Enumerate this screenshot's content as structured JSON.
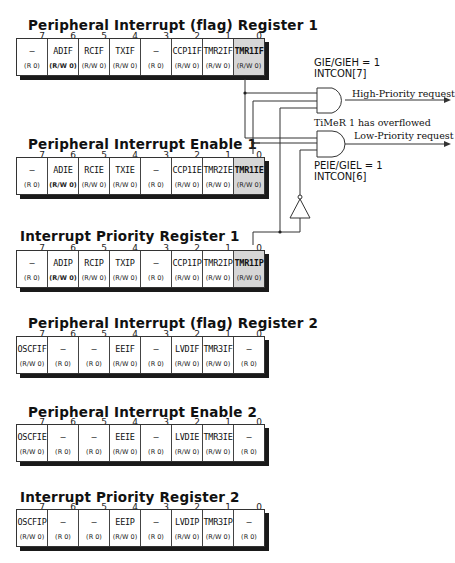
{
  "registers": [
    {
      "title": "Peripheral  Interrupt  (flag) Register 1",
      "bit_numbers": [
        "7",
        "6",
        "5",
        "4",
        "3",
        "2",
        "1",
        "0"
      ],
      "cells": [
        {
          "name": "—",
          "access": "(R 0)",
          "bold_access": false
        },
        {
          "name": "ADIF",
          "access": "(R/W 0)",
          "bold_access": true
        },
        {
          "name": "RCIF",
          "access": "(R/W 0)",
          "bold_access": false
        },
        {
          "name": "TXIF",
          "access": "(R/W 0)",
          "bold_access": false
        },
        {
          "name": "—",
          "access": "(R 0)",
          "bold_access": false
        },
        {
          "name": "CCP1IF",
          "access": "(R/W 0)",
          "bold_access": false
        },
        {
          "name": "TMR2IF",
          "access": "(R/W 0)",
          "bold_access": false
        },
        {
          "name": "TMR1IF",
          "access": "(R/W 0)",
          "bold_access": false,
          "highlighted": true
        }
      ]
    },
    {
      "title": "Peripheral  Interrupt  Enable 1",
      "bit_numbers": [
        "7",
        "6",
        "5",
        "4",
        "3",
        "2",
        "1",
        "0"
      ],
      "cells": [
        {
          "name": "—",
          "access": "(R 0)"
        },
        {
          "name": "ADIE",
          "access": "(R/W 0)",
          "bold_access": true
        },
        {
          "name": "RCIE",
          "access": "(R/W 0)"
        },
        {
          "name": "TXIE",
          "access": "(R/W 0)"
        },
        {
          "name": "—",
          "access": "(R 0)"
        },
        {
          "name": "CCP1IE",
          "access": "(R/W 0)"
        },
        {
          "name": "TMR2IE",
          "access": "(R/W 0)"
        },
        {
          "name": "TMR1IE",
          "access": "(R/W 0)",
          "highlighted": true
        }
      ]
    },
    {
      "title": "Interrupt Priority Register 1",
      "bit_numbers": [
        "7",
        "6",
        "5",
        "4",
        "3",
        "2",
        "1",
        "0"
      ],
      "cells": [
        {
          "name": "—",
          "access": "(R 0)"
        },
        {
          "name": "ADIP",
          "access": "(R/W 0)",
          "bold_access": true
        },
        {
          "name": "RCIP",
          "access": "(R/W 0)"
        },
        {
          "name": "TXIP",
          "access": "(R/W 0)"
        },
        {
          "name": "—",
          "access": "(R 0)"
        },
        {
          "name": "CCP1IP",
          "access": "(R/W 0)"
        },
        {
          "name": "TMR2IP",
          "access": "(R/W 0)"
        },
        {
          "name": "TMR1IP",
          "access": "(R/W 0)",
          "highlighted": true
        }
      ]
    },
    {
      "title": "Peripheral  Interrupt  (flag) Register 2",
      "bit_numbers": [
        "7",
        "6",
        "5",
        "4",
        "3",
        "2",
        "1",
        "0"
      ],
      "cells": [
        {
          "name": "OSCFIF",
          "access": "(R/W 0)"
        },
        {
          "name": "—",
          "access": "(R 0)"
        },
        {
          "name": "—",
          "access": "(R 0)"
        },
        {
          "name": "EEIF",
          "access": "(R/W 0)"
        },
        {
          "name": "—",
          "access": "(R 0)"
        },
        {
          "name": "LVDIF",
          "access": "(R/W 0)"
        },
        {
          "name": "TMR3IF",
          "access": "(R/W 0)"
        },
        {
          "name": "—",
          "access": "(R 0)"
        }
      ]
    },
    {
      "title": "Peripheral  Interrupt  Enable 2",
      "bit_numbers": [
        "7",
        "6",
        "5",
        "4",
        "3",
        "2",
        "1",
        "0"
      ],
      "cells": [
        {
          "name": "OSCFIE",
          "access": "(R/W 0)"
        },
        {
          "name": "—",
          "access": "(R 0)"
        },
        {
          "name": "—",
          "access": "(R 0)"
        },
        {
          "name": "EEIE",
          "access": "(R/W 0)"
        },
        {
          "name": "—",
          "access": "(R 0)"
        },
        {
          "name": "LVDIE",
          "access": "(R/W 0)"
        },
        {
          "name": "TMR3IE",
          "access": "(R/W 0)"
        },
        {
          "name": "—",
          "access": "(R 0)"
        }
      ]
    },
    {
      "title": "Interrupt Priority Register 2",
      "bit_numbers": [
        "7",
        "6",
        "5",
        "4",
        "3",
        "2",
        "1",
        "0"
      ],
      "cells": [
        {
          "name": "OSCFIP",
          "access": "(R/W 0)"
        },
        {
          "name": "—",
          "access": "(R 0)"
        },
        {
          "name": "—",
          "access": "(R 0)"
        },
        {
          "name": "EEIP",
          "access": "(R/W 0)"
        },
        {
          "name": "—",
          "access": "(R 0)"
        },
        {
          "name": "LVDIP",
          "access": "(R/W 0)"
        },
        {
          "name": "TMR3IP",
          "access": "(R/W 0)"
        },
        {
          "name": "—",
          "access": "(R 0)"
        }
      ]
    }
  ],
  "logic": {
    "gie_label_line1": "GIE/GIEH = 1",
    "gie_label_line2": "INTCON[7]",
    "high_priority_output": "High-Priority request",
    "timer_note": "TiMeR 1 has overflowed",
    "low_priority_output": "Low-Priority request",
    "peie_label_line1": "PEIE/GIEL = 1",
    "peie_label_line2": "INTCON[6]"
  },
  "colors": {
    "highlight_cell": "#d6d6d6",
    "shadow": "#1a1a1a",
    "line": "#333333"
  }
}
